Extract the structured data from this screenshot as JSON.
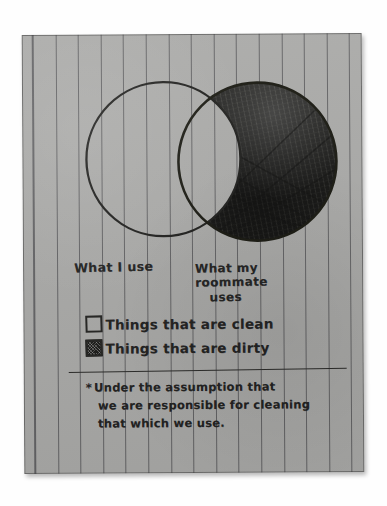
{
  "diagram": {
    "type": "venn",
    "title_present": false,
    "sets": [
      {
        "id": "left",
        "label": "What I use",
        "fill": "clean",
        "fill_description": "unshaded / blank"
      },
      {
        "id": "right",
        "label_line1": "What my roommate",
        "label_line2": "uses",
        "label": "What my roommate uses",
        "fill": "dirty",
        "fill_description": "heavy pencil scribble shading"
      }
    ],
    "intersection": {
      "fill": "clean",
      "fill_description": "unshaded / blank"
    }
  },
  "legend": {
    "items": [
      {
        "swatch": "empty-square",
        "label": "Things that are clean"
      },
      {
        "swatch": "filled-square",
        "label": "Things that are dirty"
      }
    ]
  },
  "footnote": {
    "marker": "*",
    "lines": [
      "Under the assumption that",
      "we are responsible for cleaning",
      "that which we use."
    ],
    "full_text": "* Under the assumption that we are responsible for cleaning that which we use."
  },
  "colors": {
    "paper": "#a9a9a7",
    "ink": "#21211f",
    "rule_line": "#282830",
    "background": "#ffffff",
    "shading": "#1b1b19"
  },
  "media": {
    "surface": "ruled notebook paper",
    "writing_instrument": "pencil"
  }
}
